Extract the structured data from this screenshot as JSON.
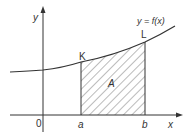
{
  "diagram": {
    "colors": {
      "stroke": "#333333",
      "hatch": "#555555",
      "background": "#ffffff"
    },
    "axes": {
      "x_label": "x",
      "y_label": "y",
      "origin_label": "0"
    },
    "curve": {
      "label": "y = f(x)"
    },
    "bounds": {
      "lower_label": "a",
      "upper_label": "b"
    },
    "points": {
      "K": "K",
      "L": "L"
    },
    "region": {
      "label": "A",
      "fill": "hatched"
    }
  }
}
